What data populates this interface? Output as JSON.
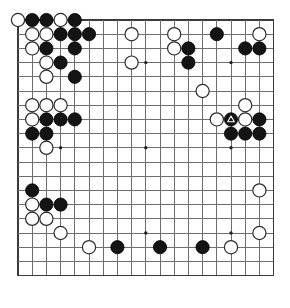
{
  "figure": {
    "board_size": 19,
    "background_color": "#ffffff",
    "line_color": "#6e6e6e",
    "border_color": "#3a3a3a",
    "black_color": "#141414",
    "white_color": "#ffffff",
    "mark_color": "#ffffff"
  },
  "geometry": {
    "origin_x": 18,
    "origin_y": 20,
    "spacing": 14.2,
    "stone_radius": 6.6
  },
  "star_points": [
    {
      "col": 4,
      "row": 4
    },
    {
      "col": 10,
      "row": 4
    },
    {
      "col": 16,
      "row": 4
    },
    {
      "col": 4,
      "row": 10
    },
    {
      "col": 10,
      "row": 10
    },
    {
      "col": 16,
      "row": 10
    },
    {
      "col": 4,
      "row": 16
    },
    {
      "col": 10,
      "row": 16
    },
    {
      "col": 16,
      "row": 16
    }
  ],
  "stones": [
    {
      "col": 1,
      "row": 1,
      "color": "white",
      "mark": ""
    },
    {
      "col": 2,
      "row": 1,
      "color": "black",
      "mark": ""
    },
    {
      "col": 3,
      "row": 1,
      "color": "black",
      "mark": ""
    },
    {
      "col": 4,
      "row": 1,
      "color": "white",
      "mark": ""
    },
    {
      "col": 5,
      "row": 1,
      "color": "black",
      "mark": ""
    },
    {
      "col": 2,
      "row": 2,
      "color": "white",
      "mark": ""
    },
    {
      "col": 3,
      "row": 2,
      "color": "white",
      "mark": ""
    },
    {
      "col": 4,
      "row": 2,
      "color": "black",
      "mark": ""
    },
    {
      "col": 5,
      "row": 2,
      "color": "black",
      "mark": ""
    },
    {
      "col": 6,
      "row": 2,
      "color": "black",
      "mark": ""
    },
    {
      "col": 9,
      "row": 2,
      "color": "white",
      "mark": ""
    },
    {
      "col": 12,
      "row": 2,
      "color": "white",
      "mark": ""
    },
    {
      "col": 15,
      "row": 2,
      "color": "black",
      "mark": ""
    },
    {
      "col": 18,
      "row": 2,
      "color": "white",
      "mark": ""
    },
    {
      "col": 2,
      "row": 3,
      "color": "white",
      "mark": ""
    },
    {
      "col": 3,
      "row": 3,
      "color": "black",
      "mark": ""
    },
    {
      "col": 5,
      "row": 3,
      "color": "black",
      "mark": ""
    },
    {
      "col": 12,
      "row": 3,
      "color": "white",
      "mark": ""
    },
    {
      "col": 13,
      "row": 3,
      "color": "black",
      "mark": ""
    },
    {
      "col": 17,
      "row": 3,
      "color": "black",
      "mark": ""
    },
    {
      "col": 18,
      "row": 3,
      "color": "black",
      "mark": ""
    },
    {
      "col": 3,
      "row": 4,
      "color": "white",
      "mark": ""
    },
    {
      "col": 4,
      "row": 4,
      "color": "black",
      "mark": ""
    },
    {
      "col": 9,
      "row": 4,
      "color": "white",
      "mark": ""
    },
    {
      "col": 13,
      "row": 4,
      "color": "black",
      "mark": ""
    },
    {
      "col": 3,
      "row": 5,
      "color": "white",
      "mark": ""
    },
    {
      "col": 5,
      "row": 5,
      "color": "black",
      "mark": ""
    },
    {
      "col": 14,
      "row": 6,
      "color": "white",
      "mark": ""
    },
    {
      "col": 2,
      "row": 7,
      "color": "white",
      "mark": ""
    },
    {
      "col": 3,
      "row": 7,
      "color": "white",
      "mark": ""
    },
    {
      "col": 4,
      "row": 7,
      "color": "white",
      "mark": ""
    },
    {
      "col": 17,
      "row": 7,
      "color": "white",
      "mark": ""
    },
    {
      "col": 2,
      "row": 8,
      "color": "white",
      "mark": ""
    },
    {
      "col": 3,
      "row": 8,
      "color": "black",
      "mark": ""
    },
    {
      "col": 4,
      "row": 8,
      "color": "black",
      "mark": ""
    },
    {
      "col": 5,
      "row": 8,
      "color": "black",
      "mark": ""
    },
    {
      "col": 15,
      "row": 8,
      "color": "white",
      "mark": ""
    },
    {
      "col": 16,
      "row": 8,
      "color": "black",
      "mark": "triangle"
    },
    {
      "col": 17,
      "row": 8,
      "color": "white",
      "mark": ""
    },
    {
      "col": 18,
      "row": 8,
      "color": "black",
      "mark": ""
    },
    {
      "col": 2,
      "row": 9,
      "color": "black",
      "mark": ""
    },
    {
      "col": 3,
      "row": 9,
      "color": "black",
      "mark": ""
    },
    {
      "col": 16,
      "row": 9,
      "color": "black",
      "mark": ""
    },
    {
      "col": 17,
      "row": 9,
      "color": "black",
      "mark": ""
    },
    {
      "col": 18,
      "row": 9,
      "color": "black",
      "mark": ""
    },
    {
      "col": 3,
      "row": 10,
      "color": "white",
      "mark": ""
    },
    {
      "col": 2,
      "row": 13,
      "color": "black",
      "mark": ""
    },
    {
      "col": 18,
      "row": 13,
      "color": "white",
      "mark": ""
    },
    {
      "col": 2,
      "row": 14,
      "color": "white",
      "mark": ""
    },
    {
      "col": 3,
      "row": 14,
      "color": "black",
      "mark": ""
    },
    {
      "col": 4,
      "row": 14,
      "color": "black",
      "mark": ""
    },
    {
      "col": 2,
      "row": 15,
      "color": "white",
      "mark": ""
    },
    {
      "col": 3,
      "row": 15,
      "color": "white",
      "mark": ""
    },
    {
      "col": 4,
      "row": 16,
      "color": "white",
      "mark": ""
    },
    {
      "col": 18,
      "row": 16,
      "color": "white",
      "mark": ""
    },
    {
      "col": 6,
      "row": 17,
      "color": "white",
      "mark": ""
    },
    {
      "col": 8,
      "row": 17,
      "color": "black",
      "mark": ""
    },
    {
      "col": 11,
      "row": 17,
      "color": "black",
      "mark": ""
    },
    {
      "col": 14,
      "row": 17,
      "color": "black",
      "mark": ""
    },
    {
      "col": 16,
      "row": 17,
      "color": "white",
      "mark": ""
    }
  ]
}
